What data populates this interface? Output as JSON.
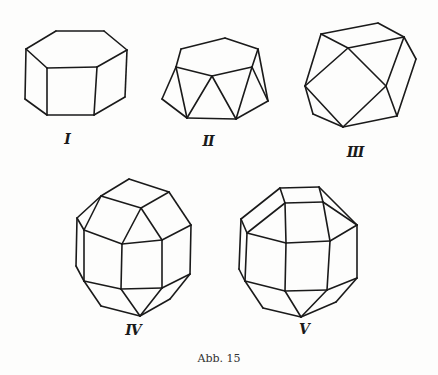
{
  "figure": {
    "caption": "Abb. 15",
    "ink_color": "#1a1a1a",
    "background": "#fdfdfc",
    "crystals": [
      {
        "id": "I",
        "label": "I",
        "shape": "hexagonal prism",
        "label_pos": [
          67,
          140
        ],
        "edges": [
          [
            [
              26,
              49
            ],
            [
              56,
              31
            ]
          ],
          [
            [
              56,
              31
            ],
            [
              104,
              31
            ]
          ],
          [
            [
              104,
              31
            ],
            [
              127,
              50
            ]
          ],
          [
            [
              127,
              50
            ],
            [
              97,
              67
            ]
          ],
          [
            [
              97,
              67
            ],
            [
              47,
              68
            ]
          ],
          [
            [
              47,
              68
            ],
            [
              26,
              49
            ]
          ],
          [
            [
              26,
              49
            ],
            [
              25,
              99
            ]
          ],
          [
            [
              47,
              68
            ],
            [
              47,
              115
            ]
          ],
          [
            [
              97,
              67
            ],
            [
              94,
              115
            ]
          ],
          [
            [
              127,
              50
            ],
            [
              125,
              97
            ]
          ],
          [
            [
              25,
              99
            ],
            [
              47,
              115
            ]
          ],
          [
            [
              47,
              115
            ],
            [
              94,
              115
            ]
          ],
          [
            [
              94,
              115
            ],
            [
              125,
              97
            ]
          ]
        ]
      },
      {
        "id": "II",
        "label": "II",
        "shape": "hexagonal antiprism-like truncated form",
        "label_pos": [
          208,
          142
        ],
        "edges": [
          [
            [
              181,
              49
            ],
            [
              225,
              38
            ]
          ],
          [
            [
              225,
              38
            ],
            [
              258,
              49
            ]
          ],
          [
            [
              258,
              49
            ],
            [
              252,
              67
            ]
          ],
          [
            [
              252,
              67
            ],
            [
              212,
              76
            ]
          ],
          [
            [
              212,
              76
            ],
            [
              176,
              67
            ]
          ],
          [
            [
              176,
              67
            ],
            [
              181,
              49
            ]
          ],
          [
            [
              176,
              67
            ],
            [
              162,
              99
            ]
          ],
          [
            [
              162,
              99
            ],
            [
              187,
              118
            ]
          ],
          [
            [
              187,
              118
            ],
            [
              236,
              119
            ]
          ],
          [
            [
              236,
              119
            ],
            [
              268,
              101
            ]
          ],
          [
            [
              268,
              101
            ],
            [
              258,
              49
            ]
          ],
          [
            [
              176,
              67
            ],
            [
              187,
              118
            ]
          ],
          [
            [
              212,
              76
            ],
            [
              187,
              118
            ]
          ],
          [
            [
              212,
              76
            ],
            [
              236,
              119
            ]
          ],
          [
            [
              252,
              67
            ],
            [
              236,
              119
            ]
          ],
          [
            [
              252,
              67
            ],
            [
              268,
              101
            ]
          ]
        ]
      },
      {
        "id": "III",
        "label": "III",
        "shape": "cuboctahedral form",
        "label_pos": [
          355,
          153
        ],
        "edges": [
          [
            [
              321,
              34
            ],
            [
              378,
              23
            ]
          ],
          [
            [
              378,
              23
            ],
            [
              404,
              37
            ]
          ],
          [
            [
              404,
              37
            ],
            [
              348,
              48
            ]
          ],
          [
            [
              348,
              48
            ],
            [
              321,
              34
            ]
          ],
          [
            [
              321,
              34
            ],
            [
              305,
              86
            ]
          ],
          [
            [
              348,
              48
            ],
            [
              305,
              86
            ]
          ],
          [
            [
              348,
              48
            ],
            [
              386,
              86
            ]
          ],
          [
            [
              404,
              37
            ],
            [
              386,
              86
            ]
          ],
          [
            [
              404,
              37
            ],
            [
              416,
              59
            ]
          ],
          [
            [
              416,
              59
            ],
            [
              397,
              116
            ]
          ],
          [
            [
              386,
              86
            ],
            [
              397,
              116
            ]
          ],
          [
            [
              386,
              86
            ],
            [
              343,
              127
            ]
          ],
          [
            [
              305,
              86
            ],
            [
              343,
              127
            ]
          ],
          [
            [
              305,
              86
            ],
            [
              313,
              114
            ]
          ],
          [
            [
              313,
              114
            ],
            [
              343,
              127
            ]
          ],
          [
            [
              343,
              127
            ],
            [
              397,
              116
            ]
          ]
        ]
      },
      {
        "id": "IV",
        "label": "IV",
        "shape": "rhombicuboctahedral form",
        "label_pos": [
          133,
          331
        ],
        "edges": [
          [
            [
              129,
              179
            ],
            [
              101,
              196
            ]
          ],
          [
            [
              129,
              179
            ],
            [
              169,
              192
            ]
          ],
          [
            [
              101,
              196
            ],
            [
              141,
              208
            ]
          ],
          [
            [
              169,
              192
            ],
            [
              141,
              208
            ]
          ],
          [
            [
              101,
              196
            ],
            [
              77,
              218
            ]
          ],
          [
            [
              77,
              218
            ],
            [
              84,
              230
            ]
          ],
          [
            [
              101,
              196
            ],
            [
              84,
              230
            ]
          ],
          [
            [
              141,
              208
            ],
            [
              122,
              244
            ]
          ],
          [
            [
              141,
              208
            ],
            [
              162,
              240
            ]
          ],
          [
            [
              169,
              192
            ],
            [
              191,
              225
            ]
          ],
          [
            [
              84,
              230
            ],
            [
              122,
              244
            ]
          ],
          [
            [
              122,
              244
            ],
            [
              162,
              240
            ]
          ],
          [
            [
              162,
              240
            ],
            [
              191,
              225
            ]
          ],
          [
            [
              77,
              218
            ],
            [
              76,
              266
            ]
          ],
          [
            [
              84,
              230
            ],
            [
              84,
              281
            ]
          ],
          [
            [
              122,
              244
            ],
            [
              121,
              289
            ]
          ],
          [
            [
              162,
              240
            ],
            [
              162,
              288
            ]
          ],
          [
            [
              191,
              225
            ],
            [
              190,
              274
            ]
          ],
          [
            [
              76,
              266
            ],
            [
              84,
              281
            ]
          ],
          [
            [
              84,
              281
            ],
            [
              121,
              289
            ]
          ],
          [
            [
              121,
              289
            ],
            [
              162,
              288
            ]
          ],
          [
            [
              162,
              288
            ],
            [
              190,
              274
            ]
          ],
          [
            [
              84,
              281
            ],
            [
              101,
              306
            ]
          ],
          [
            [
              101,
              306
            ],
            [
              140,
              316
            ]
          ],
          [
            [
              121,
              289
            ],
            [
              140,
              316
            ]
          ],
          [
            [
              162,
              288
            ],
            [
              140,
              316
            ]
          ],
          [
            [
              140,
              316
            ],
            [
              170,
              299
            ]
          ],
          [
            [
              170,
              299
            ],
            [
              190,
              274
            ]
          ]
        ]
      },
      {
        "id": "V",
        "label": "V",
        "shape": "rhombicuboctahedral form",
        "label_pos": [
          304,
          330
        ],
        "edges": [
          [
            [
              280,
              188
            ],
            [
              319,
              187
            ]
          ],
          [
            [
              280,
              188
            ],
            [
              285,
              203
            ]
          ],
          [
            [
              319,
              187
            ],
            [
              323,
              202
            ]
          ],
          [
            [
              285,
              203
            ],
            [
              323,
              202
            ]
          ],
          [
            [
              280,
              188
            ],
            [
              241,
              219
            ]
          ],
          [
            [
              285,
              203
            ],
            [
              247,
              233
            ]
          ],
          [
            [
              241,
              219
            ],
            [
              247,
              233
            ]
          ],
          [
            [
              319,
              187
            ],
            [
              357,
              225
            ]
          ],
          [
            [
              323,
              202
            ],
            [
              357,
              225
            ]
          ],
          [
            [
              247,
              233
            ],
            [
              286,
              243
            ]
          ],
          [
            [
              286,
              243
            ],
            [
              330,
              241
            ]
          ],
          [
            [
              330,
              241
            ],
            [
              357,
              225
            ]
          ],
          [
            [
              285,
              203
            ],
            [
              286,
              243
            ]
          ],
          [
            [
              323,
              202
            ],
            [
              330,
              241
            ]
          ],
          [
            [
              241,
              219
            ],
            [
              239,
              269
            ]
          ],
          [
            [
              247,
              233
            ],
            [
              245,
              281
            ]
          ],
          [
            [
              286,
              243
            ],
            [
              285,
              291
            ]
          ],
          [
            [
              330,
              241
            ],
            [
              327,
              290
            ]
          ],
          [
            [
              357,
              225
            ],
            [
              357,
              278
            ]
          ],
          [
            [
              239,
              269
            ],
            [
              245,
              281
            ]
          ],
          [
            [
              245,
              281
            ],
            [
              285,
              291
            ]
          ],
          [
            [
              285,
              291
            ],
            [
              327,
              290
            ]
          ],
          [
            [
              327,
              290
            ],
            [
              357,
              278
            ]
          ],
          [
            [
              245,
              281
            ],
            [
              263,
              308
            ]
          ],
          [
            [
              263,
              308
            ],
            [
              301,
              317
            ]
          ],
          [
            [
              285,
              291
            ],
            [
              301,
              317
            ]
          ],
          [
            [
              327,
              290
            ],
            [
              301,
              317
            ]
          ],
          [
            [
              301,
              317
            ],
            [
              336,
              302
            ]
          ],
          [
            [
              336,
              302
            ],
            [
              357,
              278
            ]
          ]
        ]
      }
    ]
  }
}
